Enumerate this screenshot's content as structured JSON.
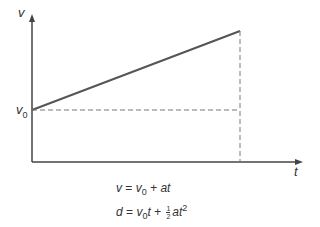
{
  "diagram": {
    "axes": {
      "y_label": "v",
      "x_label": "t",
      "y_intercept_label_base": "v",
      "y_intercept_label_sub": "0"
    },
    "equations": {
      "eq1": {
        "lhs": "v",
        "eq": "=",
        "v": "v",
        "sub": "0",
        "rest": "+ at"
      },
      "eq2": {
        "lhs": "d",
        "eq": "=",
        "v": "v",
        "sub": "0",
        "t": "t +",
        "frac_num": "1",
        "frac_den": "2",
        "at": "at",
        "sup": "2"
      }
    },
    "colors": {
      "line": "#555555",
      "dash": "#777777",
      "text": "#333333"
    }
  }
}
